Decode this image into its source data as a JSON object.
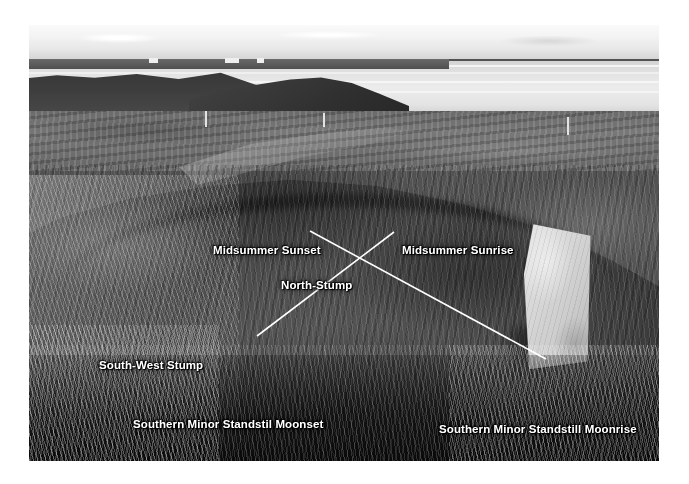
{
  "photo": {
    "subject": "Annotated black-and-white photograph of a prehistoric stone circle / henge site on coastal moorland",
    "scene_elements": [
      "overcast sky",
      "sea loch / inlet water on horizon",
      "distant low hills across the water",
      "dark near headland promontory",
      "grassy moorland middle ground with footpath",
      "large low circular earthen mound with surrounding ditch",
      "upright pale standing stone on right of mound",
      "tall wind-blown grass in dark foreground"
    ],
    "palette": {
      "sky": "#eceae7",
      "water": "#e2e0dc",
      "far_hills": "#8d8a86",
      "headland_dark": "#3d3b38",
      "moor_mid": "#7b7873",
      "mound": "#4e4b47",
      "foreground_dark": "#14130f",
      "standing_stone": "#d6d3ce",
      "annotation_white": "#ffffff"
    }
  },
  "annotations": {
    "midsummer_sunset": "Midsummer Sunset",
    "midsummer_sunrise": "Midsummer Sunrise",
    "north_stump": "North-Stump",
    "south_west_stump": "South-West Stump",
    "southern_minor_standstill_moonset": "Southern Minor Standstil Moonset",
    "southern_minor_standstill_moonrise": "Southern Minor Standstill Moonrise"
  },
  "leader_lines": {
    "description": "Two white straight sightlines crossing in an X over the centre of the mound",
    "crossing_point": {
      "x": 358,
      "y": 268
    },
    "lines": [
      {
        "name": "sunset-moonrise-sightline",
        "from_label": "Midsummer Sunset",
        "to_label": "Southern Minor Standstill Moonrise",
        "x1": 310,
        "y1": 231,
        "x2": 546,
        "y2": 359
      },
      {
        "name": "sunrise-moonset-sightline",
        "from_label": "Midsummer Sunrise",
        "to_label": "Southern Minor Standstil Moonset",
        "x1": 394,
        "y1": 232,
        "x2": 257,
        "y2": 336
      }
    ]
  },
  "standing_stone": {
    "label": "upright standing stone",
    "position": {
      "x": 489,
      "y": 198,
      "width": 74,
      "height": 148
    }
  }
}
